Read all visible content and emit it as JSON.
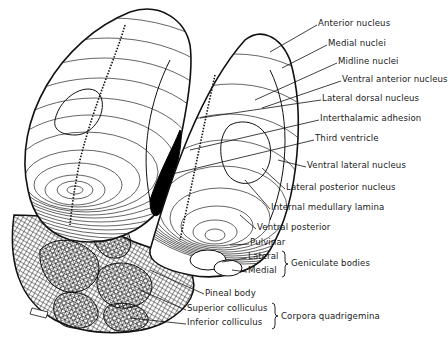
{
  "diagram": {
    "labels": [
      {
        "id": "anterior-nucleus",
        "text": "Anterior nucleus",
        "x": 318,
        "y": 22
      },
      {
        "id": "medial-nuclei",
        "text": "Medial nuclei",
        "x": 328,
        "y": 42
      },
      {
        "id": "midline-nuclei",
        "text": "Midline nuclei",
        "x": 338,
        "y": 60
      },
      {
        "id": "ventral-anterior-nucleus",
        "text": "Ventral anterior nucleus",
        "x": 342,
        "y": 78
      },
      {
        "id": "lateral-dorsal-nucleus",
        "text": "Lateral dorsal nucleus",
        "x": 322,
        "y": 97
      },
      {
        "id": "interthalamic-adhesion",
        "text": "Interthalamic adhesion",
        "x": 320,
        "y": 117
      },
      {
        "id": "third-ventricle",
        "text": "Third ventricle",
        "x": 315,
        "y": 137
      },
      {
        "id": "ventral-lateral-nucleus",
        "text": "Ventral lateral nucleus",
        "x": 307,
        "y": 164
      },
      {
        "id": "lateral-posterior-nucleus",
        "text": "Lateral posterior nucleus",
        "x": 286,
        "y": 186
      },
      {
        "id": "internal-medullary-lamina",
        "text": "Internal medullary lamina",
        "x": 271,
        "y": 206
      },
      {
        "id": "ventral-posterior",
        "text": "Ventral posterior",
        "x": 257,
        "y": 226
      },
      {
        "id": "pulvinar",
        "text": "Pulvinar",
        "x": 250,
        "y": 241
      },
      {
        "id": "lateral",
        "text": "Lateral",
        "x": 248,
        "y": 255
      },
      {
        "id": "medial",
        "text": "Medial",
        "x": 248,
        "y": 269
      },
      {
        "id": "geniculate-bodies",
        "text": "Geniculate bodies",
        "x": 289,
        "y": 261
      },
      {
        "id": "pineal-body",
        "text": "Pineal body",
        "x": 205,
        "y": 292
      },
      {
        "id": "superior-colliculus",
        "text": "Superior colliculus",
        "x": 187,
        "y": 307
      },
      {
        "id": "inferior-colliculus",
        "text": "Inferior colliculus",
        "x": 187,
        "y": 321
      },
      {
        "id": "corpora-quadrigemina",
        "text": "Corpora quadrigemina",
        "x": 279,
        "y": 314
      }
    ],
    "brackets": [
      {
        "name": "geniculate-bracket",
        "x": 281,
        "y1": 251,
        "y2": 277
      },
      {
        "name": "corpora-bracket",
        "x": 271,
        "y1": 303,
        "y2": 331
      }
    ],
    "colors": {
      "ink": "#111111",
      "paper": "#ffffff"
    }
  }
}
